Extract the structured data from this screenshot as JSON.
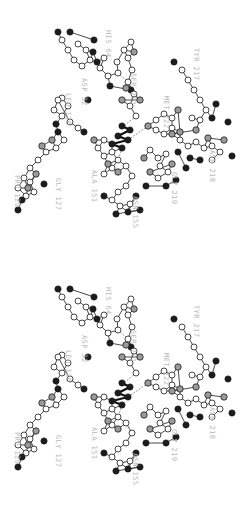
{
  "figure": {
    "kind": "stereo-pair",
    "panel_count": 2,
    "label_color": "#b9b9b9",
    "background_color": "#ffffff",
    "bond_color": "#2a2a2a",
    "text_rotation_degrees": 90
  },
  "atom_styles": {
    "open": {
      "name": "carbon",
      "fill": "#ffffff"
    },
    "gray": {
      "name": "oxygen-nitrogen",
      "fill": "#9a9a9a"
    },
    "dark": {
      "name": "heteroatom",
      "fill": "#1c1c1c"
    }
  },
  "panels": [
    {
      "id": "panel-left",
      "name": "left-eye-view"
    },
    {
      "id": "panel-right",
      "name": "right-eye-view"
    }
  ],
  "residues": [
    {
      "code": "HIS",
      "number": "64",
      "label": "HIS 64",
      "x": 112,
      "y": 30
    },
    {
      "code": "ASP",
      "number": "32",
      "label": "ASP 32",
      "x": 88,
      "y": 78
    },
    {
      "code": "SER",
      "number": "221",
      "label": "SER 221",
      "x": 137,
      "y": 73
    },
    {
      "code": "LEU",
      "number": "126",
      "label": "LEU 126",
      "x": 72,
      "y": 93
    },
    {
      "code": "TYR",
      "number": "217",
      "label": "TYR 217",
      "x": 200,
      "y": 48
    },
    {
      "code": "MET",
      "number": "222",
      "label": "MET 222",
      "x": 170,
      "y": 96
    },
    {
      "code": "GLY",
      "number": "127",
      "label": "GLY 127",
      "x": 62,
      "y": 178
    },
    {
      "code": "PRO",
      "number": "129",
      "label": "PRO 129",
      "x": 21,
      "y": 175
    },
    {
      "code": "ALA",
      "number": "151",
      "label": "ALA 151",
      "x": 98,
      "y": 170
    },
    {
      "code": "ASN",
      "number": "155",
      "label": "ASN 155",
      "x": 139,
      "y": 196
    },
    {
      "code": "GLY",
      "number": "219",
      "label": "GLY 219",
      "x": 178,
      "y": 172
    },
    {
      "code": "ASN",
      "number": "218",
      "label": "ASN 218",
      "x": 216,
      "y": 150
    }
  ],
  "chart_data": {
    "type": "scatter",
    "title": "",
    "xlabel": "",
    "ylabel": "",
    "annotations": [
      "HIS 64",
      "ASP 32",
      "SER 221",
      "LEU 126",
      "TYR 217",
      "MET 222",
      "GLY 127",
      "PRO 129",
      "ALA 151",
      "ASN 155",
      "GLY 219",
      "ASN 218"
    ],
    "legend": [],
    "grid": false,
    "series": [
      {
        "name": "his64-sidechain",
        "kind": "open",
        "points": [
          [
            104,
            58
          ],
          [
            100,
            68
          ],
          [
            108,
            76
          ],
          [
            118,
            73
          ],
          [
            117,
            62
          ],
          [
            124,
            50
          ],
          [
            131,
            42
          ]
        ]
      },
      {
        "name": "his64-backbone",
        "kind": "dark",
        "points": [
          [
            93,
            52
          ],
          [
            110,
            86
          ],
          [
            131,
            90
          ]
        ]
      },
      {
        "name": "asp32-sidechain",
        "kind": "open",
        "points": [
          [
            78,
            44
          ],
          [
            86,
            50
          ],
          [
            90,
            60
          ],
          [
            82,
            66
          ],
          [
            74,
            60
          ],
          [
            68,
            50
          ],
          [
            62,
            40
          ]
        ]
      },
      {
        "name": "asp32-oxygens",
        "kind": "dark",
        "points": [
          [
            70,
            32
          ],
          [
            94,
            40
          ],
          [
            58,
            32
          ],
          [
            97,
            62
          ]
        ]
      },
      {
        "name": "ser221-chain",
        "kind": "open",
        "points": [
          [
            128,
            58
          ],
          [
            132,
            70
          ],
          [
            128,
            82
          ],
          [
            134,
            94
          ],
          [
            130,
            106
          ],
          [
            136,
            116
          ]
        ]
      },
      {
        "name": "ser221-gray",
        "kind": "gray",
        "points": [
          [
            134,
            52
          ],
          [
            126,
            88
          ],
          [
            140,
            100
          ],
          [
            122,
            100
          ]
        ]
      },
      {
        "name": "leu126-chain",
        "kind": "open",
        "points": [
          [
            62,
            98
          ],
          [
            68,
            106
          ],
          [
            62,
            116
          ],
          [
            54,
            110
          ],
          [
            58,
            100
          ],
          [
            70,
            122
          ],
          [
            78,
            128
          ]
        ]
      },
      {
        "name": "leu126-dark",
        "kind": "dark",
        "points": [
          [
            88,
            100
          ],
          [
            56,
            124
          ],
          [
            84,
            132
          ]
        ]
      },
      {
        "name": "gly127-pro129-chain",
        "kind": "open",
        "points": [
          [
            64,
            140
          ],
          [
            56,
            148
          ],
          [
            46,
            152
          ],
          [
            38,
            160
          ],
          [
            30,
            168
          ],
          [
            24,
            178
          ],
          [
            18,
            188
          ],
          [
            26,
            196
          ],
          [
            34,
            192
          ],
          [
            30,
            182
          ]
        ]
      },
      {
        "name": "gly127-pro129-gray",
        "kind": "gray",
        "points": [
          [
            52,
            140
          ],
          [
            42,
            146
          ],
          [
            36,
            174
          ],
          [
            28,
            188
          ]
        ]
      },
      {
        "name": "gly127-pro129-dark",
        "kind": "dark",
        "points": [
          [
            58,
            132
          ],
          [
            44,
            184
          ],
          [
            18,
            210
          ],
          [
            22,
            200
          ]
        ]
      },
      {
        "name": "inhibitor-core",
        "kind": "dark",
        "points": [
          [
            122,
            126
          ],
          [
            130,
            130
          ],
          [
            118,
            136
          ],
          [
            128,
            140
          ],
          [
            112,
            144
          ],
          [
            122,
            148
          ]
        ]
      },
      {
        "name": "ala151-chain",
        "kind": "open",
        "points": [
          [
            104,
            140
          ],
          [
            98,
            148
          ],
          [
            104,
            156
          ],
          [
            112,
            152
          ],
          [
            118,
            160
          ],
          [
            112,
            168
          ],
          [
            104,
            174
          ]
        ]
      },
      {
        "name": "ala151-gray",
        "kind": "gray",
        "points": [
          [
            94,
            140
          ],
          [
            108,
            164
          ],
          [
            118,
            172
          ]
        ]
      },
      {
        "name": "asn155-chain",
        "kind": "open",
        "points": [
          [
            126,
            166
          ],
          [
            132,
            176
          ],
          [
            126,
            186
          ],
          [
            118,
            192
          ],
          [
            112,
            200
          ],
          [
            120,
            206
          ],
          [
            130,
            204
          ]
        ]
      },
      {
        "name": "asn155-dark",
        "kind": "dark",
        "points": [
          [
            104,
            196
          ],
          [
            136,
            196
          ],
          [
            128,
            212
          ],
          [
            140,
            210
          ],
          [
            116,
            214
          ]
        ]
      },
      {
        "name": "met222-ring",
        "kind": "open",
        "points": [
          [
            156,
            120
          ],
          [
            164,
            114
          ],
          [
            172,
            118
          ],
          [
            172,
            128
          ],
          [
            164,
            134
          ],
          [
            156,
            130
          ]
        ]
      },
      {
        "name": "met222-gray",
        "kind": "gray",
        "points": [
          [
            148,
            126
          ],
          [
            178,
            110
          ],
          [
            180,
            132
          ]
        ]
      },
      {
        "name": "tyr217-chain",
        "kind": "open",
        "points": [
          [
            182,
            70
          ],
          [
            188,
            80
          ],
          [
            194,
            90
          ],
          [
            200,
            100
          ],
          [
            206,
            110
          ],
          [
            200,
            120
          ],
          [
            192,
            118
          ]
        ]
      },
      {
        "name": "tyr217-dark",
        "kind": "dark",
        "points": [
          [
            174,
            62
          ],
          [
            212,
            118
          ],
          [
            216,
            104
          ]
        ]
      },
      {
        "name": "gly219-asn218-chain",
        "kind": "open",
        "points": [
          [
            180,
            140
          ],
          [
            188,
            146
          ],
          [
            196,
            142
          ],
          [
            204,
            148
          ],
          [
            212,
            146
          ],
          [
            220,
            152
          ],
          [
            212,
            160
          ]
        ]
      },
      {
        "name": "gly219-asn218-gray",
        "kind": "gray",
        "points": [
          [
            172,
            134
          ],
          [
            196,
            130
          ],
          [
            224,
            140
          ],
          [
            208,
            138
          ]
        ]
      },
      {
        "name": "gly219-asn218-dark",
        "kind": "dark",
        "points": [
          [
            232,
            156
          ],
          [
            200,
            160
          ],
          [
            190,
            158
          ],
          [
            228,
            122
          ],
          [
            186,
            168
          ],
          [
            178,
            152
          ]
        ]
      },
      {
        "name": "lower-right-chain",
        "kind": "open",
        "points": [
          [
            150,
            150
          ],
          [
            158,
            158
          ],
          [
            166,
            154
          ],
          [
            160,
            166
          ],
          [
            168,
            172
          ],
          [
            158,
            178
          ]
        ]
      },
      {
        "name": "lower-right-gray",
        "kind": "gray",
        "points": [
          [
            144,
            158
          ],
          [
            172,
            164
          ],
          [
            150,
            172
          ]
        ]
      },
      {
        "name": "lower-right-dark",
        "kind": "dark",
        "points": [
          [
            146,
            186
          ],
          [
            166,
            186
          ],
          [
            176,
            180
          ]
        ]
      }
    ]
  }
}
